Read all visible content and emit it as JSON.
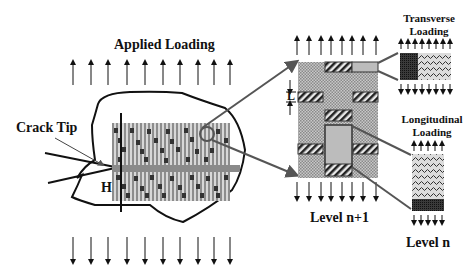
{
  "labels": {
    "applied_loading": "Applied Loading",
    "crack_tip": "Crack Tip",
    "h": "H",
    "l": "L",
    "level_n1": "Level n+1",
    "level_n": "Level n",
    "transverse_1": "Transverse",
    "transverse_2": "Loading",
    "longitudinal_1": "Longitudinal",
    "longitudinal_2": "Loading"
  },
  "colors": {
    "line": "#111111",
    "gray_arrow": "#555555",
    "composite_fill": "#9a9a9a",
    "fiber_fill": "#bdbdbd",
    "dark_fill": "#2a2a2a"
  }
}
